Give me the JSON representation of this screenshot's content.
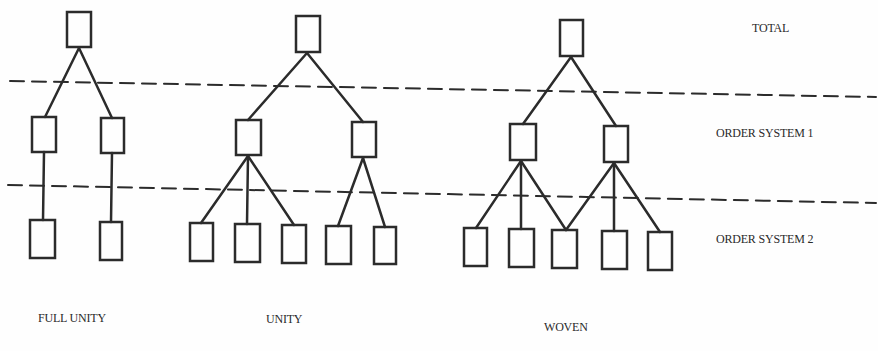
{
  "levels": {
    "total": "TOTAL",
    "order1": "ORDER SYSTEM 1",
    "order2": "ORDER SYSTEM 2"
  },
  "diagrams": [
    {
      "name": "FULL UNITY",
      "description": "Each order-system-1 node connects to exactly one order-system-2 node"
    },
    {
      "name": "UNITY",
      "description": "Tree: 2 order-system-1 nodes; left has 3 children, right has 2"
    },
    {
      "name": "WOVEN",
      "description": "2 order-system-1 nodes share the middle order-system-2 node"
    }
  ],
  "colors": {
    "stroke": "#2b2b2b",
    "background": "#fefefe"
  }
}
